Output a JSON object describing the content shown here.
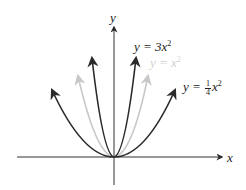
{
  "diagram": {
    "axes": {
      "x_label": "x",
      "y_label": "y"
    },
    "curves": [
      {
        "name": "y = 3x^2",
        "label_prefix": "y = 3x",
        "exponent": "2",
        "coefficient": 3,
        "color": "#2a2a2a"
      },
      {
        "name": "y = x^2",
        "label_prefix": "y = x",
        "exponent": "2",
        "coefficient": 1,
        "color": "#c8c8c8"
      },
      {
        "name": "y = 1/4 x^2",
        "label_prefix": "y = ",
        "frac_num": "1",
        "frac_den": "4",
        "label_suffix": "x",
        "exponent": "2",
        "coefficient": 0.25,
        "color": "#2a2a2a"
      }
    ]
  }
}
